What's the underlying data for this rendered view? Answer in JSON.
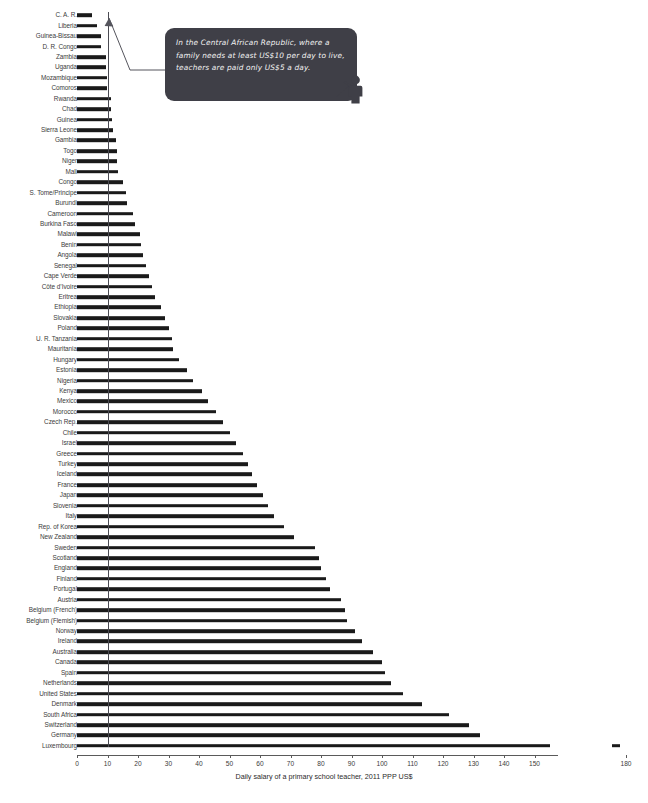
{
  "chart_data": {
    "type": "bar",
    "orientation": "horizontal",
    "title": "",
    "xlabel": "Daily salary of a primary school teacher, 2011 PPP US$",
    "ylabel": "",
    "xlim": [
      0,
      180
    ],
    "xticks": [
      0,
      10,
      20,
      30,
      40,
      50,
      60,
      70,
      80,
      90,
      100,
      110,
      120,
      130,
      140,
      150,
      180
    ],
    "grid": false,
    "legend": null,
    "axis_break": {
      "present": true,
      "after": 155,
      "before": 175,
      "note": "Luxembourg bar is drawn with a broken axis; final segment sits near 180"
    },
    "reference_line": {
      "value": 10,
      "label": "US$10 per day poverty/living line",
      "color": "#4a4a52"
    },
    "bar_color": "#1a1a1a",
    "categories": [
      "C. A. R.",
      "Liberia",
      "Guinea-Bissau",
      "D. R. Congo",
      "Zambia",
      "Uganda",
      "Mozambique",
      "Comoros",
      "Rwanda",
      "Chad",
      "Guinea",
      "Sierra Leone",
      "Gambia",
      "Togo",
      "Niger",
      "Mali",
      "Congo",
      "S. Tome/Principe",
      "Burundi",
      "Cameroon",
      "Burkina Faso",
      "Malawi",
      "Benin",
      "Angola",
      "Senegal",
      "Cape Verde",
      "Côte d’Ivoire",
      "Eritrea",
      "Ethiopia",
      "Slovakia",
      "Poland",
      "U. R. Tanzania",
      "Mauritania",
      "Hungary",
      "Estonia",
      "Nigeria",
      "Kenya",
      "Mexico",
      "Morocco",
      "Czech Rep.",
      "Chile",
      "Israel",
      "Greece",
      "Turkey",
      "Iceland",
      "France",
      "Japan",
      "Slovenia",
      "Italy",
      "Rep. of Korea",
      "New Zealand",
      "Sweden",
      "Scotland",
      "England",
      "Finland",
      "Portugal",
      "Austria",
      "Belgium (French)",
      "Belgium (Flemish)",
      "Norway",
      "Ireland",
      "Australia",
      "Canada",
      "Spain",
      "Netherlands",
      "United States",
      "Denmark",
      "South Africa",
      "Switzerland",
      "Germany",
      "Luxembourg"
    ],
    "values": [
      5.0,
      6.6,
      7.8,
      8.0,
      9.5,
      9.6,
      9.7,
      9.8,
      11.0,
      11.2,
      11.5,
      11.8,
      12.8,
      13.0,
      13.2,
      13.4,
      15.2,
      16.0,
      16.5,
      18.5,
      19.0,
      20.5,
      21.0,
      21.5,
      22.5,
      23.5,
      24.5,
      25.5,
      27.5,
      29.0,
      30.0,
      31.0,
      31.5,
      33.5,
      36.0,
      38.0,
      41.0,
      43.0,
      45.5,
      48.0,
      50.0,
      52.0,
      54.5,
      56.0,
      57.5,
      59.0,
      61.0,
      62.5,
      64.5,
      68.0,
      71.0,
      78.0,
      79.5,
      80.0,
      81.5,
      83.0,
      86.5,
      88.0,
      88.5,
      91.0,
      93.5,
      97.0,
      100.0,
      101.0,
      103.0,
      107.0,
      113.0,
      122.0,
      128.5,
      132.0,
      178.0
    ]
  },
  "callout": {
    "text": "In the Central African Republic, where a family needs at least US$10 per day to live, teachers are paid only US$5 a day.",
    "background": "#3f3f47",
    "text_color": "#f2f2f2",
    "icon": "teacher-icon"
  },
  "axis": {
    "title": "Daily salary of a primary school teacher, 2011 PPP US$"
  },
  "source": {
    "note": ""
  }
}
